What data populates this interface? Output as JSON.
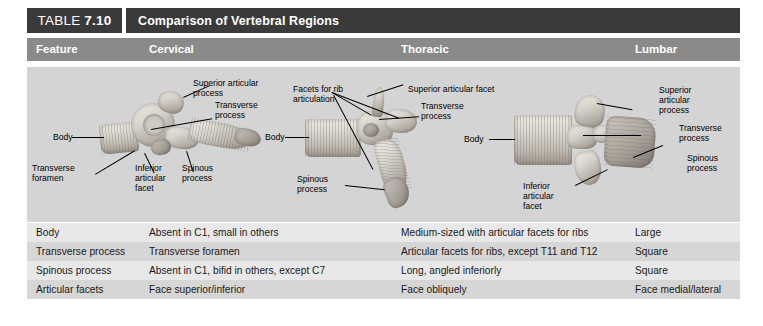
{
  "table": {
    "number_word": "TABLE",
    "number": "7.10",
    "title": "Comparison of Vertebral Regions",
    "columns": [
      "Feature",
      "Cervical",
      "Thoracic",
      "Lumbar"
    ],
    "rows": [
      {
        "feature": "Body",
        "cervical": "Absent in C1, small in others",
        "thoracic": "Medium-sized with articular facets for ribs",
        "lumbar": "Large"
      },
      {
        "feature": "Transverse process",
        "cervical": "Transverse foramen",
        "thoracic": "Articular facets for ribs, except T11 and T12",
        "lumbar": "Square"
      },
      {
        "feature": "Spinous process",
        "cervical": "Absent in C1, bifid in others, except C7",
        "thoracic": "Long, angled inferiorly",
        "lumbar": "Square"
      },
      {
        "feature": "Articular facets",
        "cervical": "Face superior/inferior",
        "thoracic": "Face obliquely",
        "lumbar": "Face medial/lateral"
      }
    ]
  },
  "figures": {
    "cervical": {
      "caption_name": "cervical-vertebra-illustration",
      "labels": [
        "Superior articular\nprocess",
        "Transverse\nprocess",
        "Body",
        "Transverse\nforamen",
        "Inferior\narticular\nfacet",
        "Spinous\nprocess"
      ]
    },
    "thoracic": {
      "caption_name": "thoracic-vertebra-illustration",
      "labels": [
        "Facets for rib\narticulation",
        "Superior articular facet",
        "Transverse\nprocess",
        "Body",
        "Spinous\nprocess"
      ]
    },
    "lumbar": {
      "caption_name": "lumbar-vertebra-illustration",
      "labels": [
        "Superior\narticular\nprocess",
        "Transverse\nprocess",
        "Spinous\nprocess",
        "Body",
        "Inferior\narticular\nfacet"
      ]
    }
  },
  "colors": {
    "header_dark": "#3a3a3a",
    "column_header_gray": "#8a8a8a",
    "figure_band": "#d4d4d4",
    "row_odd": "#e8e8e8",
    "row_even": "#d6d6d6",
    "page_background": "#ffffff"
  }
}
